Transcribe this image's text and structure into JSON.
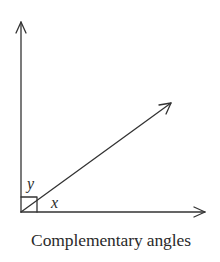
{
  "diagram": {
    "title": "Complementary angles",
    "labels": {
      "angle_upper": "y",
      "angle_lower": "x"
    },
    "elements": {
      "vertical_ray": "arrow pointing up",
      "horizontal_ray": "arrow pointing right",
      "diagonal_ray": "arrow pointing up-right",
      "right_angle_marker": "square at vertex"
    },
    "colors": {
      "line": "#333333",
      "background": "#ffffff"
    }
  }
}
